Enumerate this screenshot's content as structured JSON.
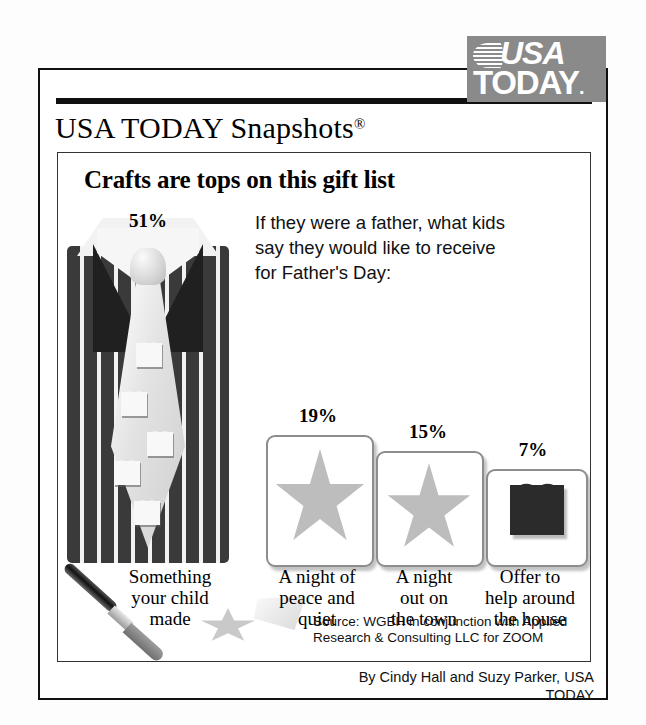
{
  "masthead": {
    "title": "USA TODAY Snapshots",
    "registered_mark": "®",
    "logo": {
      "line1": "USA",
      "line2": "TODAY",
      "line2_dot": ".",
      "background_color": "#8a8a8a",
      "text_color": "#ffffff"
    }
  },
  "chart_data": {
    "type": "bar",
    "title": "Crafts are tops on this gift list",
    "subtitle": "If they were a father, what kids say they would like to receive for Father's Day:",
    "categories": [
      "Something your child made",
      "A night of peace and quiet",
      "A night out on the town",
      "Offer to help around the house"
    ],
    "values": [
      51,
      19,
      15,
      7
    ],
    "value_labels": [
      "51%",
      "19%",
      "15%",
      "7%"
    ],
    "xlabel": "",
    "ylabel": "",
    "ylim": [
      0,
      55
    ],
    "grid": false,
    "legend": "none",
    "icons": [
      "pinstripe-suit-with-heart-tie",
      "gray-star-card",
      "gray-star-card",
      "black-heart-card"
    ]
  },
  "labels": {
    "cat1_line1": "Something",
    "cat1_line2": "your child",
    "cat1_line3": "made",
    "cat2_line1": "A night of",
    "cat2_line2": "peace and",
    "cat2_line3": "quiet",
    "cat3_line1": "A night",
    "cat3_line2": "out on",
    "cat3_line3": "the town",
    "cat4_line1": "Offer to",
    "cat4_line2": "help around",
    "cat4_line3": "the house"
  },
  "footer": {
    "source_line1": "Source: WGBH in conjunction with Applied",
    "source_line2": "Research & Consulting LLC for ZOOM",
    "byline": "By Cindy Hall and Suzy Parker, USA TODAY"
  },
  "colors": {
    "frame": "#111111",
    "logo_gray": "#8a8a8a",
    "star_gray": "#bdbdbd",
    "heart_black": "#2b2b2b",
    "suit_dark": "#3a3a3a",
    "tie_light": "#e2e2e2"
  }
}
